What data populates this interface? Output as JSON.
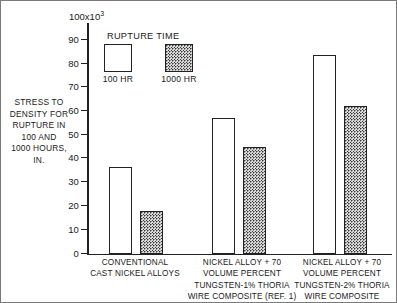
{
  "chart_data": {
    "type": "bar",
    "title": "",
    "ylabel": "STRESS TO DENSITY FOR RUPTURE IN 100 AND 1000 HOURS, IN.",
    "ylabel_lines": [
      "STRESS TO",
      "DENSITY FOR",
      "RUPTURE IN",
      "100 AND",
      "1000 HOURS,",
      "IN."
    ],
    "xlabel": "",
    "ylim": [
      0,
      100
    ],
    "y_multiplier": "100x10",
    "y_multiplier_exponent": "3",
    "y_ticks": [
      0,
      10,
      20,
      30,
      40,
      50,
      60,
      70,
      80,
      90
    ],
    "y_tick_labels": [
      "0",
      "10",
      "20",
      "30",
      "40",
      "50",
      "60",
      "70",
      "80",
      "90"
    ],
    "grid": false,
    "legend_title": "RUPTURE TIME",
    "legend_position": "upper-left-inside",
    "categories": [
      "CONVENTIONAL CAST NICKEL ALLOYS",
      "NICKEL ALLOY + 70 VOLUME PERCENT TUNGSTEN-1% THORIA WIRE COMPOSITE (REF. 1)",
      "NICKEL ALLOY + 70 VOLUME PERCENT TUNGSTEN-2% THORIA WIRE COMPOSITE"
    ],
    "category_lines": [
      [
        "CONVENTIONAL",
        "CAST NICKEL ALLOYS"
      ],
      [
        "NICKEL ALLOY + 70",
        "VOLUME PERCENT",
        "TUNGSTEN-1% THORIA",
        "WIRE COMPOSITE (REF. 1)"
      ],
      [
        "NICKEL ALLOY + 70",
        "VOLUME PERCENT",
        "TUNGSTEN-2% THORIA",
        "WIRE COMPOSITE"
      ]
    ],
    "series": [
      {
        "name": "100 HR",
        "values": [
          36.5,
          57.0,
          83.5
        ],
        "fill": "open"
      },
      {
        "name": "1000 HR",
        "values": [
          18.0,
          44.5,
          62.0
        ],
        "fill": "stippled"
      }
    ]
  },
  "axis": {
    "exponent_base": "100x10",
    "exponent_sup": "3",
    "tick_0": "0",
    "tick_10": "10",
    "tick_20": "20",
    "tick_30": "30",
    "tick_40": "40",
    "tick_50": "50",
    "tick_60": "60",
    "tick_70": "70",
    "tick_80": "80",
    "tick_90": "90"
  },
  "y_title": {
    "line1": "STRESS TO",
    "line2": "DENSITY FOR",
    "line3": "RUPTURE IN",
    "line4": "100 AND",
    "line5": "1000 HOURS,",
    "line6": "IN."
  },
  "legend": {
    "title": "RUPTURE TIME",
    "item1_label": "100 HR",
    "item2_label": "1000 HR"
  },
  "categories": {
    "c1_line1": "CONVENTIONAL",
    "c1_line2": "CAST NICKEL ALLOYS",
    "c2_line1": "NICKEL ALLOY + 70",
    "c2_line2": "VOLUME PERCENT",
    "c2_line3": "TUNGSTEN-1% THORIA",
    "c2_line4": "WIRE COMPOSITE (REF. 1)",
    "c3_line1": "NICKEL ALLOY + 70",
    "c3_line2": "VOLUME PERCENT",
    "c3_line3": "TUNGSTEN-2% THORIA",
    "c3_line4": "WIRE COMPOSITE"
  },
  "colors": {
    "ink": "#222222",
    "background": "#ffffff",
    "stipple_fill": "#d9d9d9",
    "stipple_dot": "#3a3a3a"
  }
}
